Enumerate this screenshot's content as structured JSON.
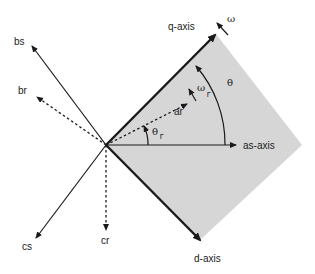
{
  "colors": {
    "line": "#1a1a1a",
    "shade": "#d6d6d6",
    "text": "#222222"
  },
  "axes": {
    "q_axis": "q-axis",
    "d_axis": "d-axis",
    "as_axis": "as-axis",
    "bs": "bs",
    "cs": "cs",
    "ar": "ar",
    "br": "br",
    "cr": "cr"
  },
  "symbols": {
    "omega": "ω",
    "omega_r_base": "ω",
    "omega_r_sub": "r",
    "theta": "θ",
    "theta_r_base": "θ",
    "theta_r_sub": "r"
  }
}
